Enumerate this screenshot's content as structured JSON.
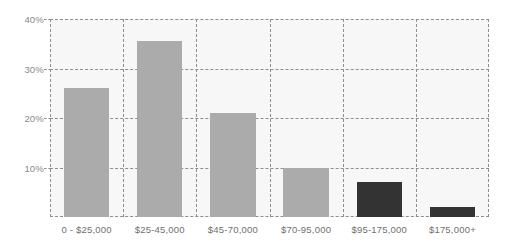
{
  "chart_data": {
    "type": "bar",
    "title": "",
    "subtitle": "",
    "xlabel": "",
    "ylabel": "",
    "categories": [
      "0 - $25,000",
      "$25-45,000",
      "$45-70,000",
      "$70-95,000",
      "$95-175,000",
      "$175,000+"
    ],
    "values": [
      26,
      35.5,
      21,
      10,
      7,
      2
    ],
    "value_labels": [
      "26%",
      "35.5%",
      "21%",
      "10%",
      "7%",
      "2%"
    ],
    "bar_colors": [
      "#ababab",
      "#ababab",
      "#ababab",
      "#ababab",
      "#333333",
      "#333333"
    ],
    "ylim": [
      0,
      40
    ],
    "yticks": [
      40,
      30,
      20,
      10
    ],
    "ytick_labels": [
      "40%",
      "30%",
      "20%",
      "10%"
    ],
    "grid": "dashed",
    "grid_color": "#8e8e8e",
    "plot_background": "#f7f7f7",
    "legend": "none",
    "legend_entries": [],
    "annotations": []
  },
  "axis": {
    "y_label_color": "#8a8a8a",
    "x_label_color": "#6f6f6f"
  }
}
